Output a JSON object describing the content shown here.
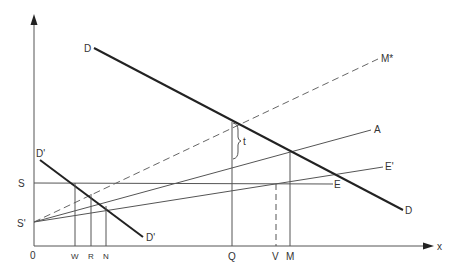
{
  "diagram": {
    "axes": {
      "origin_label": "0",
      "x_axis_label": "x"
    },
    "y_axis_labels": {
      "S": "S",
      "S_prime": "S'"
    },
    "x_axis_ticks": {
      "W": "W",
      "R": "R",
      "N": "N",
      "Q": "Q",
      "V": "V",
      "M": "M"
    },
    "curves": {
      "D_start": "D",
      "D_end": "D",
      "D_prime_start": "D'",
      "D_prime_end": "D'",
      "M_star": "M*",
      "A": "A",
      "E_prime": "E'",
      "E": "E"
    },
    "annotations": {
      "tax_gap": "t"
    },
    "colors": {
      "line": "#555555",
      "demand_line": "#222222",
      "text": "#333333"
    }
  }
}
